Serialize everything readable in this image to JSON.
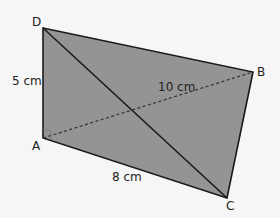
{
  "diagram": {
    "type": "quadrilateral-with-diagonals",
    "fill_color": "#949494",
    "stroke_color": "#1a1a1a",
    "background": "#f6f6f6",
    "vertices": {
      "A": {
        "label": "A"
      },
      "B": {
        "label": "B"
      },
      "C": {
        "label": "C"
      },
      "D": {
        "label": "D"
      }
    },
    "measurements": {
      "AD": "5 cm",
      "AC": "8 cm",
      "AB": "10 cm"
    },
    "right_angle_at": "A",
    "lines": [
      {
        "from": "D",
        "to": "C",
        "style": "solid"
      },
      {
        "from": "A",
        "to": "B",
        "style": "dashed"
      }
    ]
  }
}
